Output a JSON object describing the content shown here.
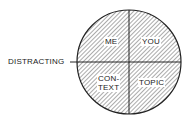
{
  "diagram": {
    "left_label": "DISTRACTING",
    "quadrants": {
      "top_left": "ME",
      "top_right": "YOU",
      "bottom_left_line1": "CON-",
      "bottom_left_line2": "TEXT",
      "bottom_right": "TOPIC"
    },
    "colors": {
      "stroke": "#222222",
      "hatch": "#333333",
      "background": "#ffffff"
    }
  }
}
